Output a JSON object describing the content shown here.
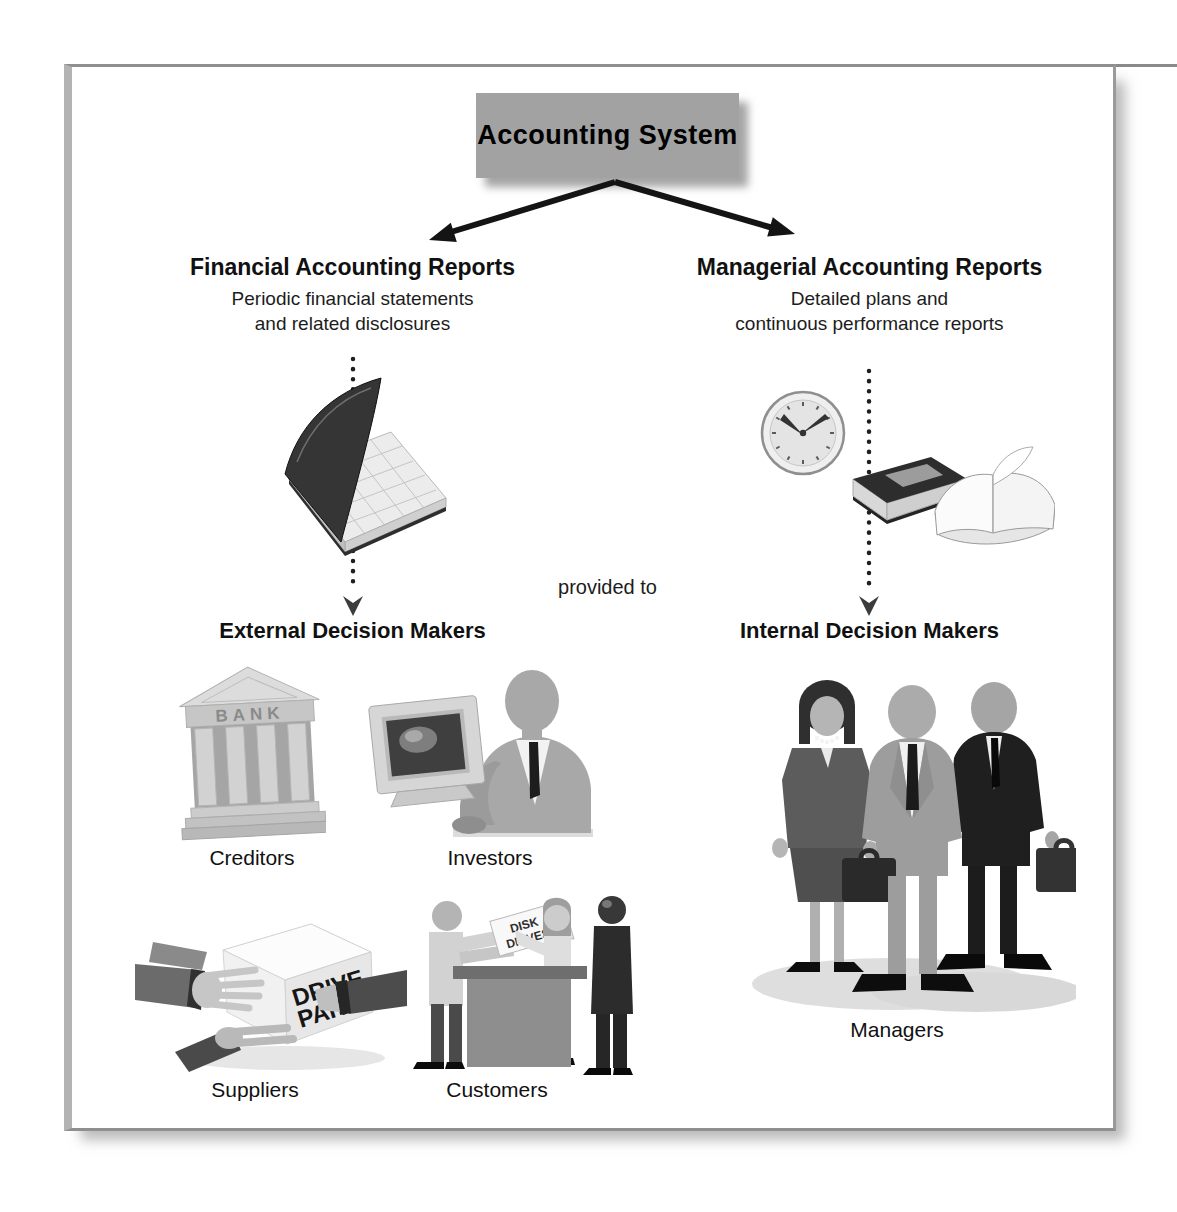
{
  "figure": {
    "title": "Accounting System",
    "provided_to_label": "provided to",
    "branches": {
      "left": {
        "heading": "Financial Accounting Reports",
        "description_line1": "Periodic financial statements",
        "description_line2": "and related disclosures",
        "audience_heading": "External Decision Makers",
        "groups": [
          {
            "label": "Creditors",
            "icon": "bank-building-icon",
            "sign_text": "BANK"
          },
          {
            "label": "Investors",
            "icon": "investor-computer-icon"
          },
          {
            "label": "Suppliers",
            "icon": "hands-passing-box-icon",
            "box_text_line1": "DRIVE",
            "box_text_line2": "PARTS"
          },
          {
            "label": "Customers",
            "icon": "store-counter-icon",
            "box_text_line1": "DISK",
            "box_text_line2": "DRIVES"
          }
        ]
      },
      "right": {
        "heading": "Managerial Accounting Reports",
        "description_line1": "Detailed plans and",
        "description_line2": "continuous performance reports",
        "audience_heading": "Internal Decision Makers",
        "groups": [
          {
            "label": "Managers",
            "icon": "three-businesspeople-icon"
          }
        ]
      }
    },
    "colors": {
      "title_box_bg": "#a2a2a2",
      "frame_border": "#9a9a9a",
      "arrow": "#1a1a1a",
      "text": "#111111"
    }
  }
}
